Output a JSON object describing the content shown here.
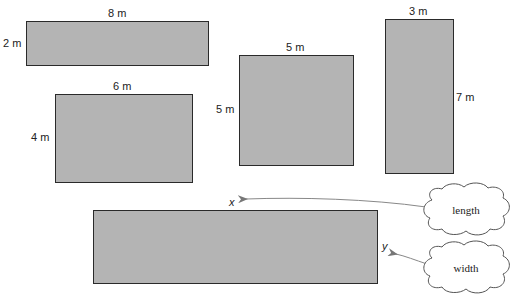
{
  "rectangles": [
    {
      "id": "rect-8x2",
      "top_label": "8 m",
      "side_label": "2 m",
      "length": 8,
      "width": 2
    },
    {
      "id": "rect-6x4",
      "top_label": "6 m",
      "side_label": "4 m",
      "length": 6,
      "width": 4
    },
    {
      "id": "rect-5x5",
      "top_label": "5 m",
      "side_label": "5 m",
      "length": 5,
      "width": 5
    },
    {
      "id": "rect-3x7",
      "top_label": "3 m",
      "side_label": "7 m",
      "length": 3,
      "width": 7
    }
  ],
  "variable_rect": {
    "length_var": "x",
    "width_var": "y"
  },
  "clouds": {
    "length": "length",
    "width": "width"
  },
  "colors": {
    "fill": "#b4b4b4",
    "stroke": "#2a2a2a",
    "arrow": "#888888"
  }
}
